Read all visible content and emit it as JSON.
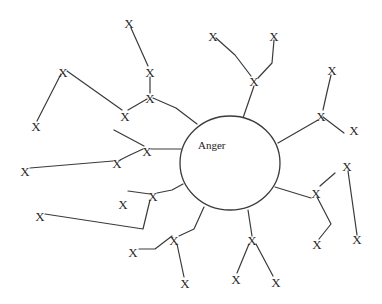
{
  "diagram": {
    "type": "mind-map",
    "center": {
      "label": "Anger",
      "cx": 230,
      "cy": 163,
      "rx": 50,
      "ry": 47,
      "label_x": 198,
      "label_y": 149
    },
    "node_label": "X",
    "colors": {
      "stroke": "#3a3a3a",
      "background": "#ffffff",
      "text": "#2a2a2a"
    },
    "nodes": [
      {
        "id": "n1",
        "x": 129,
        "y": 24
      },
      {
        "id": "n2",
        "x": 150,
        "y": 73
      },
      {
        "id": "n3",
        "x": 150,
        "y": 99
      },
      {
        "id": "n4",
        "x": 63,
        "y": 73
      },
      {
        "id": "n5",
        "x": 36,
        "y": 127
      },
      {
        "id": "n6",
        "x": 125,
        "y": 117
      },
      {
        "id": "n7",
        "x": 213,
        "y": 37
      },
      {
        "id": "n8",
        "x": 274,
        "y": 37
      },
      {
        "id": "n9",
        "x": 254,
        "y": 82
      },
      {
        "id": "n10",
        "x": 332,
        "y": 71
      },
      {
        "id": "n11",
        "x": 321,
        "y": 117
      },
      {
        "id": "n12",
        "x": 354,
        "y": 131
      },
      {
        "id": "n13",
        "x": 147,
        "y": 152
      },
      {
        "id": "n14",
        "x": 117,
        "y": 164
      },
      {
        "id": "n15",
        "x": 25,
        "y": 172
      },
      {
        "id": "n16",
        "x": 153,
        "y": 197
      },
      {
        "id": "n17",
        "x": 123,
        "y": 205
      },
      {
        "id": "n18",
        "x": 40,
        "y": 217
      },
      {
        "id": "n19",
        "x": 174,
        "y": 241
      },
      {
        "id": "n20",
        "x": 133,
        "y": 253
      },
      {
        "id": "n21",
        "x": 185,
        "y": 284
      },
      {
        "id": "n22",
        "x": 252,
        "y": 241
      },
      {
        "id": "n23",
        "x": 236,
        "y": 280
      },
      {
        "id": "n24",
        "x": 276,
        "y": 283
      },
      {
        "id": "n25",
        "x": 316,
        "y": 194
      },
      {
        "id": "n26",
        "x": 317,
        "y": 245
      },
      {
        "id": "n27",
        "x": 347,
        "y": 167
      },
      {
        "id": "n28",
        "x": 357,
        "y": 240
      }
    ],
    "edges": [
      {
        "points": "131,28 148,66"
      },
      {
        "points": "150,77 150,93"
      },
      {
        "points": "147,99 128,110"
      },
      {
        "points": "153,98 176,108 197,124"
      },
      {
        "points": "37,121 61,74"
      },
      {
        "points": "67,71 122,110"
      },
      {
        "points": "216,38 235,55 251,76"
      },
      {
        "points": "274,40 272,63 258,78"
      },
      {
        "points": "254,86 243,118"
      },
      {
        "points": "331,75 327,92 323,110"
      },
      {
        "points": "323,117 344,133"
      },
      {
        "points": "318,120 278,143"
      },
      {
        "points": "114,130 144,146"
      },
      {
        "points": "120,160 130,155 143,149"
      },
      {
        "points": "30,168 113,161"
      },
      {
        "points": "151,149 181,149"
      },
      {
        "points": "183,184 172,190 157,193"
      },
      {
        "points": "150,194 128,191"
      },
      {
        "points": "150,200 143,229 45,214"
      },
      {
        "points": "139,249 155,249 172,236"
      },
      {
        "points": "204,207 194,229 179,236"
      },
      {
        "points": "177,244 184,277"
      },
      {
        "points": "248,210 252,236"
      },
      {
        "points": "249,244 237,273"
      },
      {
        "points": "256,244 273,276"
      },
      {
        "points": "275,187 311,198"
      },
      {
        "points": "320,186 335,173"
      },
      {
        "points": "317,197 331,224 319,239"
      },
      {
        "points": "348,171 357,235"
      }
    ]
  }
}
